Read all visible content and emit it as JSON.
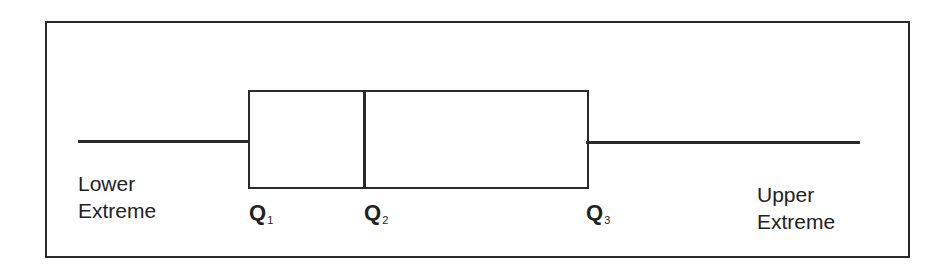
{
  "diagram": {
    "type": "box-plot-schematic",
    "labels": {
      "lower_extreme_line1": "Lower",
      "lower_extreme_line2": "Extreme",
      "upper_extreme_line1": "Upper",
      "upper_extreme_line2": "Extreme",
      "q1_letter": "Q",
      "q1_sub": "1",
      "q2_letter": "Q",
      "q2_sub": "2",
      "q3_letter": "Q",
      "q3_sub": "3"
    },
    "colors": {
      "stroke": "#2a2a2a",
      "background": "#ffffff",
      "text": "#222222"
    }
  }
}
